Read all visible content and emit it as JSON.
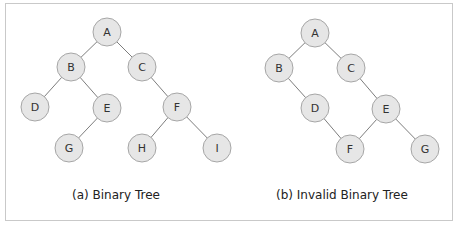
{
  "figure": {
    "panels": [
      {
        "caption": "(a) Binary Tree",
        "nodes": [
          {
            "id": "A",
            "label": "A",
            "x": 107,
            "y": 32
          },
          {
            "id": "B",
            "label": "B",
            "x": 71,
            "y": 67
          },
          {
            "id": "C",
            "label": "C",
            "x": 142,
            "y": 67
          },
          {
            "id": "D",
            "label": "D",
            "x": 35,
            "y": 107
          },
          {
            "id": "E",
            "label": "E",
            "x": 107,
            "y": 108
          },
          {
            "id": "F",
            "label": "F",
            "x": 177,
            "y": 107
          },
          {
            "id": "G",
            "label": "G",
            "x": 69,
            "y": 148
          },
          {
            "id": "H",
            "label": "H",
            "x": 142,
            "y": 148
          },
          {
            "id": "I",
            "label": "I",
            "x": 217,
            "y": 148
          }
        ],
        "edges": [
          [
            "A",
            "B"
          ],
          [
            "A",
            "C"
          ],
          [
            "B",
            "D"
          ],
          [
            "B",
            "E"
          ],
          [
            "E",
            "G"
          ],
          [
            "C",
            "F"
          ],
          [
            "F",
            "H"
          ],
          [
            "F",
            "I"
          ]
        ]
      },
      {
        "caption": "(b) Invalid Binary Tree",
        "nodes": [
          {
            "id": "A",
            "label": "A",
            "x": 315,
            "y": 33
          },
          {
            "id": "B",
            "label": "B",
            "x": 279,
            "y": 68
          },
          {
            "id": "C",
            "label": "C",
            "x": 351,
            "y": 68
          },
          {
            "id": "D",
            "label": "D",
            "x": 315,
            "y": 108
          },
          {
            "id": "E",
            "label": "E",
            "x": 386,
            "y": 109
          },
          {
            "id": "F",
            "label": "F",
            "x": 350,
            "y": 149
          },
          {
            "id": "G",
            "label": "G",
            "x": 425,
            "y": 149
          }
        ],
        "edges": [
          [
            "A",
            "B"
          ],
          [
            "A",
            "C"
          ],
          [
            "B",
            "D"
          ],
          [
            "D",
            "F"
          ],
          [
            "C",
            "E"
          ],
          [
            "E",
            "F"
          ],
          [
            "E",
            "G"
          ]
        ]
      }
    ],
    "style": {
      "node_fill": "#e6e6e6",
      "node_stroke": "#a6a6a6",
      "edge_color": "#7d7d7d",
      "node_radius": 14
    }
  }
}
